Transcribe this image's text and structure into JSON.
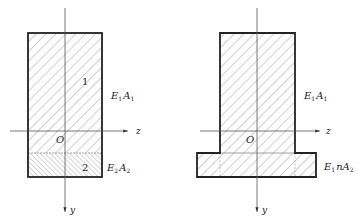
{
  "figures": [
    {
      "id": "composite-section",
      "regions": [
        {
          "number": "1",
          "label": {
            "E": "E",
            "E_sub": "1",
            "A": "A",
            "A_sub": "1"
          }
        },
        {
          "number": "2",
          "label": {
            "E": "E",
            "E_sub": "2",
            "A": "A",
            "A_sub": "2"
          }
        }
      ],
      "axes": {
        "origin": "O",
        "horizontal": "z",
        "vertical": "y"
      }
    },
    {
      "id": "transformed-section",
      "regions": [
        {
          "label": {
            "E": "E",
            "E_sub": "1",
            "A": "A",
            "A_sub": "1"
          }
        },
        {
          "label": {
            "E": "E",
            "E_sub": "1",
            "n": "n",
            "A": "A",
            "A_sub": "2"
          }
        }
      ],
      "axes": {
        "origin": "O",
        "horizontal": "z",
        "vertical": "y"
      }
    }
  ],
  "colors": {
    "outline": "#222222",
    "hatch": "#8a8a8a",
    "axis": "#555555"
  }
}
